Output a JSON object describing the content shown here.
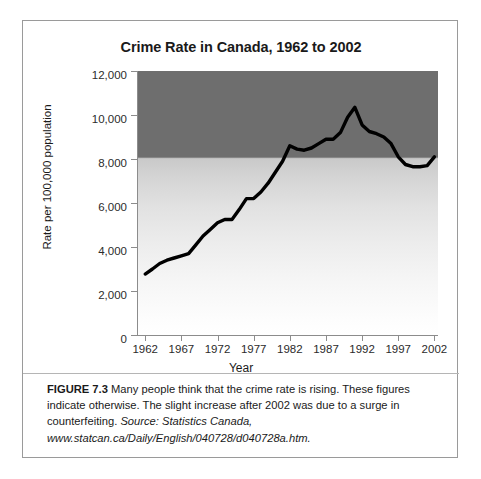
{
  "figure": {
    "title": "Crime Rate in Canada, 1962 to 2002",
    "caption_figure_number": "FIGURE 7.3",
    "caption_body": " Many people think that the crime rate is rising. These figures indicate otherwise. The slight increase after 2002 was due to a surge in counterfeiting. ",
    "caption_source": "Source: Statistics Canada, www.statcan.ca/Daily/English/040728/d040728a.htm."
  },
  "chart_data": {
    "type": "line",
    "title": "Crime Rate in Canada, 1962 to 2002",
    "xlabel": "Year",
    "ylabel": "Rate per 100,000 population",
    "xlim": [
      1961,
      2002.5
    ],
    "ylim": [
      0,
      12000
    ],
    "grid": false,
    "legend": null,
    "x_tick_labels": [
      "1962",
      "1967",
      "1972",
      "1977",
      "1982",
      "1987",
      "1992",
      "1997",
      "2002"
    ],
    "x_tick_values": [
      1962,
      1967,
      1972,
      1977,
      1982,
      1987,
      1992,
      1997,
      2002
    ],
    "y_tick_labels": [
      "0",
      "2,000",
      "4,000",
      "6,000",
      "8,000",
      "10,000",
      "12,000"
    ],
    "y_tick_values": [
      0,
      2000,
      4000,
      6000,
      8000,
      10000,
      12000
    ],
    "background": "vertical grayscale gradient, dark band above 8,000 fading to white at 0",
    "series": [
      {
        "name": "Crime rate per 100,000 population",
        "color": "#000000",
        "x": [
          1962,
          1963,
          1964,
          1965,
          1966,
          1967,
          1968,
          1969,
          1970,
          1971,
          1972,
          1973,
          1974,
          1975,
          1976,
          1977,
          1978,
          1979,
          1980,
          1981,
          1982,
          1983,
          1984,
          1985,
          1986,
          1987,
          1988,
          1989,
          1990,
          1991,
          1992,
          1993,
          1994,
          1995,
          1996,
          1997,
          1998,
          1999,
          2000,
          2001,
          2002
        ],
        "values": [
          2771,
          3000,
          3250,
          3400,
          3500,
          3600,
          3700,
          4100,
          4500,
          4800,
          5100,
          5250,
          5250,
          5700,
          6200,
          6200,
          6500,
          6900,
          7400,
          7900,
          8600,
          8450,
          8400,
          8500,
          8700,
          8900,
          8900,
          9200,
          9900,
          10350,
          9550,
          9250,
          9150,
          9000,
          8700,
          8100,
          7750,
          7650,
          7650,
          7700,
          8100
        ]
      }
    ]
  },
  "axes": {
    "y_title": "Rate per 100,000 population",
    "x_title": "Year"
  }
}
